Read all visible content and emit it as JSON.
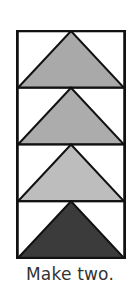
{
  "figure": {
    "blocks": [
      {
        "shape": "flying-geese",
        "fill": "#a9a9a9"
      },
      {
        "shape": "flying-geese",
        "fill": "#acacac"
      },
      {
        "shape": "flying-geese",
        "fill": "#bdbdbd"
      },
      {
        "shape": "flying-geese",
        "fill": "#3b3b3b"
      }
    ],
    "caption": "Make two."
  }
}
